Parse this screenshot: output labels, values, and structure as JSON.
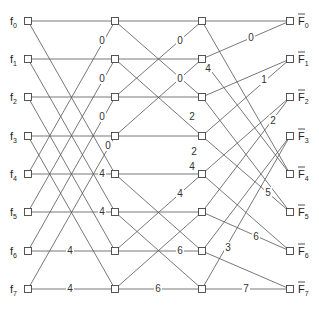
{
  "diagram": {
    "columns_x": [
      28,
      115,
      202,
      290
    ],
    "rows_y": [
      21,
      59,
      97,
      136,
      174,
      212,
      251,
      289
    ],
    "inputs": [
      {
        "base": "f",
        "sub": "0"
      },
      {
        "base": "f",
        "sub": "1"
      },
      {
        "base": "f",
        "sub": "2"
      },
      {
        "base": "f",
        "sub": "3"
      },
      {
        "base": "f",
        "sub": "4"
      },
      {
        "base": "f",
        "sub": "5"
      },
      {
        "base": "f",
        "sub": "6"
      },
      {
        "base": "f",
        "sub": "7"
      }
    ],
    "outputs": [
      {
        "base": "F",
        "sub": "0",
        "bar": true
      },
      {
        "base": "F",
        "sub": "1",
        "bar": true
      },
      {
        "base": "F",
        "sub": "2",
        "bar": true
      },
      {
        "base": "F",
        "sub": "3",
        "bar": true
      },
      {
        "base": "F",
        "sub": "4",
        "bar": true
      },
      {
        "base": "F",
        "sub": "5",
        "bar": true
      },
      {
        "base": "F",
        "sub": "6",
        "bar": true
      },
      {
        "base": "F",
        "sub": "7",
        "bar": true
      }
    ],
    "stages": [
      {
        "from": 0,
        "to": 1,
        "edges": [
          [
            0,
            0
          ],
          [
            1,
            1
          ],
          [
            2,
            2
          ],
          [
            3,
            3
          ],
          [
            4,
            4
          ],
          [
            5,
            5
          ],
          [
            6,
            6
          ],
          [
            7,
            7
          ],
          [
            0,
            4
          ],
          [
            1,
            5
          ],
          [
            2,
            6
          ],
          [
            3,
            7
          ],
          [
            4,
            0
          ],
          [
            5,
            1
          ],
          [
            6,
            2
          ],
          [
            7,
            3
          ]
        ],
        "labels": [
          {
            "text": "0",
            "x": 102,
            "y": 44
          },
          {
            "text": "0",
            "x": 102,
            "y": 82
          },
          {
            "text": "0",
            "x": 102,
            "y": 120
          },
          {
            "text": "0",
            "x": 108,
            "y": 149
          },
          {
            "text": "4",
            "x": 102,
            "y": 177
          },
          {
            "text": "4",
            "x": 102,
            "y": 215
          },
          {
            "text": "4",
            "x": 70,
            "y": 254
          },
          {
            "text": "4",
            "x": 70,
            "y": 292
          }
        ]
      },
      {
        "from": 1,
        "to": 2,
        "edges": [
          [
            0,
            0
          ],
          [
            1,
            1
          ],
          [
            2,
            2
          ],
          [
            3,
            3
          ],
          [
            4,
            4
          ],
          [
            5,
            5
          ],
          [
            6,
            6
          ],
          [
            7,
            7
          ],
          [
            0,
            2
          ],
          [
            1,
            3
          ],
          [
            2,
            0
          ],
          [
            3,
            1
          ],
          [
            4,
            6
          ],
          [
            5,
            7
          ],
          [
            6,
            4
          ],
          [
            7,
            5
          ]
        ],
        "labels": [
          {
            "text": "0",
            "x": 180,
            "y": 44
          },
          {
            "text": "0",
            "x": 180,
            "y": 82
          },
          {
            "text": "2",
            "x": 192,
            "y": 120
          },
          {
            "text": "2",
            "x": 194,
            "y": 155
          },
          {
            "text": "4",
            "x": 192,
            "y": 170
          },
          {
            "text": "4",
            "x": 180,
            "y": 197
          },
          {
            "text": "6",
            "x": 180,
            "y": 254
          },
          {
            "text": "6",
            "x": 158,
            "y": 292
          }
        ]
      },
      {
        "from": 2,
        "to": 3,
        "edges": [
          [
            0,
            0
          ],
          [
            1,
            0
          ],
          [
            0,
            4
          ],
          [
            1,
            4
          ],
          [
            2,
            1
          ],
          [
            3,
            1
          ],
          [
            2,
            5
          ],
          [
            3,
            5
          ],
          [
            4,
            2
          ],
          [
            5,
            2
          ],
          [
            4,
            6
          ],
          [
            5,
            6
          ],
          [
            6,
            3
          ],
          [
            7,
            3
          ],
          [
            6,
            7
          ],
          [
            7,
            7
          ]
        ],
        "labels": [
          {
            "text": "0",
            "x": 251,
            "y": 41
          },
          {
            "text": "4",
            "x": 208,
            "y": 72
          },
          {
            "text": "1",
            "x": 264,
            "y": 83
          },
          {
            "text": "2",
            "x": 273,
            "y": 124
          },
          {
            "text": "5",
            "x": 268,
            "y": 196
          },
          {
            "text": "6",
            "x": 256,
            "y": 240
          },
          {
            "text": "3",
            "x": 228,
            "y": 251
          },
          {
            "text": "7",
            "x": 246,
            "y": 292
          }
        ]
      }
    ]
  }
}
